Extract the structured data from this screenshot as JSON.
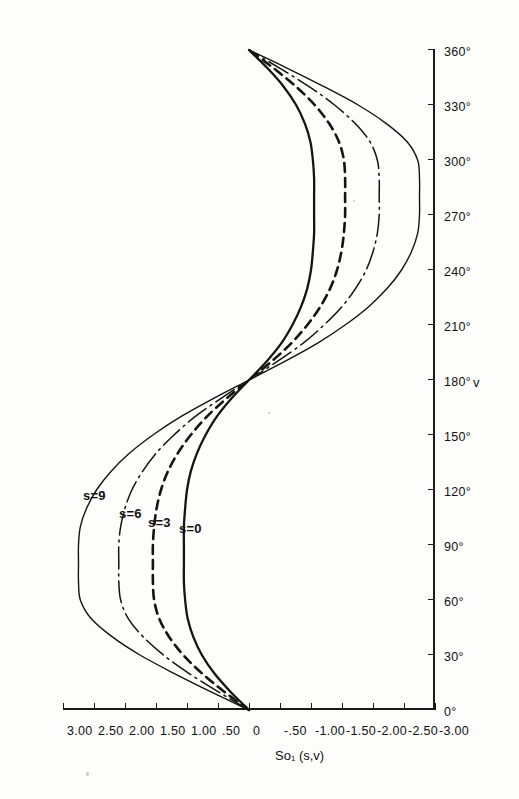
{
  "chart_data": {
    "type": "line",
    "title": "",
    "subtitle": "",
    "xlabel": "v",
    "ylabel": "So₁ (s,v)",
    "orientation": "rotated-90",
    "grid": false,
    "legend": "inline-curve-labels",
    "xlim": [
      0,
      360
    ],
    "ylim": [
      -3.0,
      3.0
    ],
    "x_tick_labels": [
      "0°",
      "30°",
      "60°",
      "90°",
      "120°",
      "150°",
      "180°",
      "210°",
      "240°",
      "270°",
      "300°",
      "330°",
      "360°"
    ],
    "x_tick_values": [
      0,
      30,
      60,
      90,
      120,
      150,
      180,
      210,
      240,
      270,
      300,
      330,
      360
    ],
    "y_tick_labels": [
      "3.00",
      "2.50",
      "2.00",
      "1.50",
      "1.00",
      ".50",
      "0",
      "-.50",
      "-1.00",
      "-1.50",
      "-2.00",
      "-2.50",
      "-3.00"
    ],
    "y_tick_values": [
      3.0,
      2.5,
      2.0,
      1.5,
      1.0,
      0.5,
      0.0,
      -0.5,
      -1.0,
      -1.5,
      -2.0,
      -2.5,
      -3.0
    ],
    "x": [
      0,
      10,
      20,
      30,
      40,
      50,
      60,
      70,
      80,
      90,
      100,
      110,
      120,
      130,
      140,
      150,
      160,
      170,
      180,
      190,
      200,
      210,
      220,
      230,
      240,
      250,
      260,
      270,
      280,
      290,
      300,
      310,
      320,
      330,
      340,
      350,
      360
    ],
    "series": [
      {
        "name": "s=0",
        "label": "s=0",
        "style": "solid",
        "peak_value": 1.05,
        "peak_angle": 100,
        "trough_value": -1.05,
        "trough_angle": 260,
        "values": [
          0,
          0.3,
          0.56,
          0.76,
          0.9,
          0.99,
          1.03,
          1.05,
          1.05,
          1.05,
          1.05,
          1.03,
          1.0,
          0.94,
          0.84,
          0.7,
          0.52,
          0.28,
          0,
          -0.28,
          -0.52,
          -0.7,
          -0.84,
          -0.94,
          -1.0,
          -1.03,
          -1.05,
          -1.05,
          -1.05,
          -1.05,
          -1.03,
          -0.99,
          -0.9,
          -0.76,
          -0.56,
          -0.3,
          0
        ]
      },
      {
        "name": "s=3",
        "label": "s=3",
        "style": "dashed",
        "peak_value": 1.55,
        "peak_angle": 95,
        "trough_value": -1.55,
        "trough_angle": 265,
        "values": [
          0,
          0.4,
          0.76,
          1.06,
          1.29,
          1.45,
          1.53,
          1.55,
          1.55,
          1.55,
          1.53,
          1.49,
          1.42,
          1.31,
          1.15,
          0.94,
          0.68,
          0.36,
          0,
          -0.36,
          -0.68,
          -0.94,
          -1.15,
          -1.31,
          -1.42,
          -1.49,
          -1.53,
          -1.55,
          -1.55,
          -1.55,
          -1.53,
          -1.45,
          -1.29,
          -1.06,
          -0.76,
          -0.4,
          0
        ]
      },
      {
        "name": "s=6",
        "label": "s=6",
        "style": "dash-dot",
        "peak_value": 2.1,
        "peak_angle": 92,
        "trough_value": -2.1,
        "trough_angle": 268,
        "values": [
          0,
          0.5,
          0.97,
          1.38,
          1.71,
          1.95,
          2.07,
          2.1,
          2.1,
          2.1,
          2.07,
          2.0,
          1.89,
          1.72,
          1.5,
          1.21,
          0.87,
          0.45,
          0,
          -0.45,
          -0.87,
          -1.21,
          -1.5,
          -1.72,
          -1.89,
          -2.0,
          -2.07,
          -2.1,
          -2.1,
          -2.1,
          -2.07,
          -1.95,
          -1.71,
          -1.38,
          -0.97,
          -0.5,
          0
        ]
      },
      {
        "name": "s=9",
        "label": "s=9",
        "style": "thin-solid",
        "peak_value": 2.75,
        "peak_angle": 90,
        "trough_value": -2.75,
        "trough_angle": 270,
        "values": [
          0,
          0.62,
          1.21,
          1.76,
          2.21,
          2.55,
          2.72,
          2.75,
          2.75,
          2.75,
          2.72,
          2.62,
          2.46,
          2.23,
          1.93,
          1.55,
          1.1,
          0.57,
          0,
          -0.57,
          -1.1,
          -1.55,
          -1.93,
          -2.23,
          -2.46,
          -2.62,
          -2.72,
          -2.75,
          -2.75,
          -2.75,
          -2.72,
          -2.55,
          -2.21,
          -1.76,
          -1.21,
          -0.62,
          0
        ]
      }
    ],
    "curve_labels": [
      {
        "text": "s=9",
        "angle": 118,
        "value": 2.35
      },
      {
        "text": "s=6",
        "angle": 108,
        "value": 1.78
      },
      {
        "text": "s=3",
        "angle": 103,
        "value": 1.3
      },
      {
        "text": "s=0",
        "angle": 100,
        "value": 0.8
      }
    ]
  }
}
